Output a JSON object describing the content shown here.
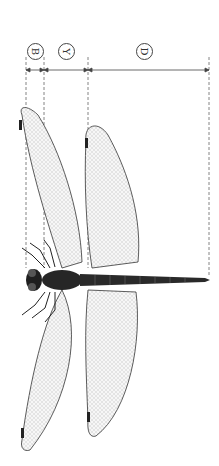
{
  "figure": {
    "orientation": "rotated 90 degrees clockwise",
    "colors": {
      "ink": "#1a1a1a",
      "dim_line": "#555555",
      "wing_fill": "#f2f2f2",
      "body": "#222222"
    }
  },
  "dimensions": [
    {
      "id": "B",
      "label": "B",
      "x_start": 26,
      "x_end": 44
    },
    {
      "id": "Y",
      "label": "Y",
      "x_start": 44,
      "x_end": 88
    },
    {
      "id": "D",
      "label": "D",
      "x_start": 88,
      "x_end": 209
    }
  ]
}
